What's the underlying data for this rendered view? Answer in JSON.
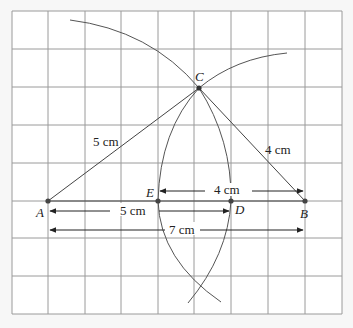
{
  "diagram": {
    "grid": {
      "x0": 12,
      "y0": 11,
      "cols": 9,
      "rows": 8,
      "xs": [
        12,
        48,
        85,
        121,
        158,
        194,
        231,
        268,
        305,
        342
      ],
      "ys": [
        11,
        49,
        87,
        125,
        163,
        201,
        238,
        276,
        314
      ],
      "line_color": "#9a9a9a",
      "fill": "#ffffff"
    },
    "points": {
      "A": {
        "label": "A",
        "x": 48,
        "y": 201
      },
      "B": {
        "label": "B",
        "x": 305,
        "y": 201
      },
      "C": {
        "label": "C",
        "x": 199,
        "y": 88
      },
      "D": {
        "label": "D",
        "x": 231,
        "y": 201
      },
      "E": {
        "label": "E",
        "x": 158,
        "y": 201
      }
    },
    "segments": {
      "AC": {
        "label": "5 cm"
      },
      "BC": {
        "label": "4 cm"
      }
    },
    "measures": {
      "AD": {
        "label": "5 cm"
      },
      "EB": {
        "label": "4 cm"
      },
      "AB": {
        "label": "7 cm"
      }
    },
    "ink_color": "#444444"
  }
}
